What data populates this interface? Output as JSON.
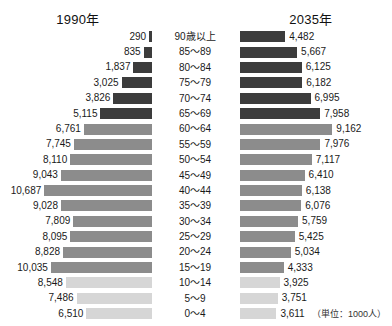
{
  "header": {
    "left_title": "1990年",
    "right_title": "2035年"
  },
  "footer": {
    "unit_note": "（単位：1000人）"
  },
  "colors": {
    "elderly": "#3c3c3c",
    "working": "#8c8c8c",
    "young": "#d6d6d6",
    "text": "#1a1a1a",
    "background": "#ffffff"
  },
  "chart_data": {
    "type": "bar",
    "subtype": "population-pyramid",
    "title": "",
    "xlabel": "",
    "ylabel": "",
    "unit": "1000人",
    "legend_position": "none",
    "grid": false,
    "px_per_unit": 0.01008,
    "categories": [
      "90歳以上",
      "85〜89",
      "80〜84",
      "75〜79",
      "70〜74",
      "65〜69",
      "60〜64",
      "55〜59",
      "50〜54",
      "45〜49",
      "40〜44",
      "35〜39",
      "30〜34",
      "25〜29",
      "20〜24",
      "15〜19",
      "10〜14",
      "5〜9",
      "0〜4"
    ],
    "group_of_category": [
      "elderly",
      "elderly",
      "elderly",
      "elderly",
      "elderly",
      "elderly",
      "working",
      "working",
      "working",
      "working",
      "working",
      "working",
      "working",
      "working",
      "working",
      "working",
      "young",
      "young",
      "young"
    ],
    "series": [
      {
        "name": "1990年",
        "side": "left",
        "values": [
          290,
          835,
          1837,
          3025,
          3826,
          5115,
          6761,
          7745,
          8110,
          9043,
          10687,
          9028,
          7809,
          8095,
          8828,
          10035,
          8548,
          7486,
          6510
        ],
        "labels": [
          "290",
          "835",
          "1,837",
          "3,025",
          "3,826",
          "5,115",
          "6,761",
          "7,745",
          "8,110",
          "9,043",
          "10,687",
          "9,028",
          "7,809",
          "8,095",
          "8,828",
          "10,035",
          "8,548",
          "7,486",
          "6,510"
        ]
      },
      {
        "name": "2035年",
        "side": "right",
        "values": [
          4482,
          5667,
          6125,
          6182,
          6995,
          7958,
          9162,
          7976,
          7117,
          6410,
          6138,
          6076,
          5759,
          5425,
          5034,
          4333,
          3925,
          3751,
          3611
        ],
        "labels": [
          "4,482",
          "5,667",
          "6,125",
          "6,182",
          "6,995",
          "7,958",
          "9,162",
          "7,976",
          "7,117",
          "6,410",
          "6,138",
          "6,076",
          "5,759",
          "5,425",
          "5,034",
          "4,333",
          "3,925",
          "3,751",
          "3,611"
        ]
      }
    ]
  }
}
